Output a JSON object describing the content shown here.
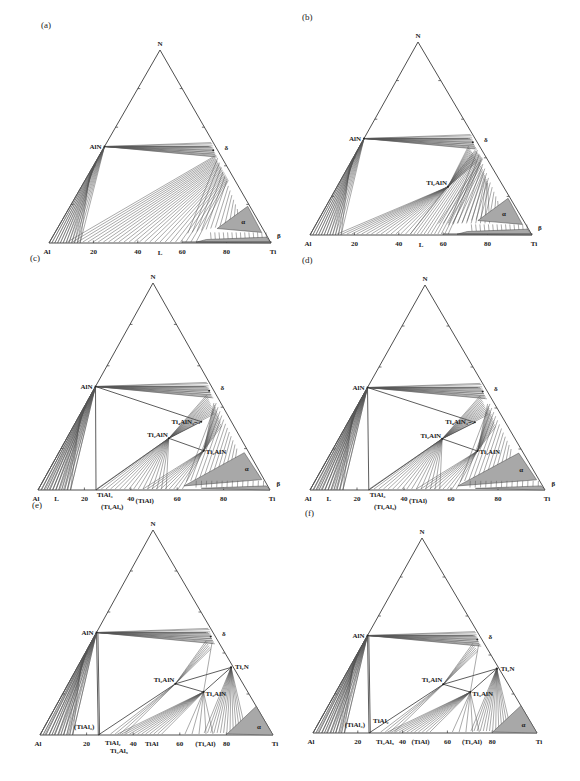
{
  "panels": [
    {
      "id": "a",
      "label": "(a)",
      "geom": {
        "al": [
          49,
          243
        ],
        "ti": [
          271,
          243
        ],
        "n": [
          160,
          50
        ]
      },
      "corners": {
        "al": "Al",
        "ti": "Ti",
        "n": "N"
      },
      "ticks": [
        "20",
        "40",
        "60",
        "80"
      ],
      "phases": [
        {
          "name": "AlN",
          "label": "AlN"
        },
        {
          "name": "delta",
          "label": "δ"
        },
        {
          "name": "alpha",
          "label": "α"
        },
        {
          "name": "beta",
          "label": "β"
        },
        {
          "name": "liquid",
          "label": "L"
        }
      ]
    },
    {
      "id": "b",
      "label": "(b)",
      "geom": {
        "al": [
          310,
          235
        ],
        "ti": [
          532,
          235
        ],
        "n": [
          418,
          42
        ]
      },
      "corners": {
        "al": "Al",
        "ti": "Ti",
        "n": "N"
      },
      "ticks": [
        "20",
        "40",
        "60",
        "80"
      ],
      "phases": [
        {
          "name": "AlN",
          "label": "AlN"
        },
        {
          "name": "delta",
          "label": "δ"
        },
        {
          "name": "Ti2AlN",
          "label": "Ti₂AlN"
        },
        {
          "name": "alpha",
          "label": "α"
        },
        {
          "name": "beta",
          "label": "β"
        },
        {
          "name": "liquid",
          "label": "L"
        }
      ]
    },
    {
      "id": "c",
      "label": "(c)",
      "geom": {
        "al": [
          38,
          490
        ],
        "ti": [
          270,
          490
        ],
        "n": [
          153,
          283
        ]
      },
      "corners": {
        "al": "Al",
        "ti": "Ti",
        "n": "N"
      },
      "ticks": [
        "20",
        "40",
        "60",
        "80"
      ],
      "phases": [
        {
          "name": "AlN",
          "label": "AlN"
        },
        {
          "name": "delta",
          "label": "δ"
        },
        {
          "name": "Ti4AlN3",
          "label": "Ti₄AlN₃₋ₓ"
        },
        {
          "name": "Ti2AlN",
          "label": "Ti₂AlN"
        },
        {
          "name": "Ti3AlN",
          "label": "Ti₃AlN"
        },
        {
          "name": "alpha",
          "label": "α"
        },
        {
          "name": "beta",
          "label": "β"
        },
        {
          "name": "liquid",
          "label": "L"
        },
        {
          "name": "TiAl3",
          "label": "TiAl₃"
        },
        {
          "name": "Ti2Al5",
          "label": "(Ti₂Al₅)"
        },
        {
          "name": "TiAl",
          "label": "(TiAl)"
        }
      ]
    },
    {
      "id": "d",
      "label": "(d)",
      "geom": {
        "al": [
          310,
          490
        ],
        "ti": [
          545,
          490
        ],
        "n": [
          425,
          285
        ]
      },
      "corners": {
        "al": "Al",
        "ti": "Ti",
        "n": "N"
      },
      "ticks": [
        "20",
        "40",
        "60",
        "80"
      ],
      "phases": [
        {
          "name": "AlN",
          "label": "AlN"
        },
        {
          "name": "delta",
          "label": "δ"
        },
        {
          "name": "Ti4AlN3",
          "label": "Ti₄AlN₃₋ₓ"
        },
        {
          "name": "Ti2AlN",
          "label": "Ti₂AlN"
        },
        {
          "name": "Ti3AlN",
          "label": "Ti₃AlN"
        },
        {
          "name": "alpha",
          "label": "α"
        },
        {
          "name": "beta",
          "label": "β"
        },
        {
          "name": "liquid",
          "label": "L"
        },
        {
          "name": "TiAl3",
          "label": "TiAl₃"
        },
        {
          "name": "Ti2Al5",
          "label": "(Ti₂Al₅)"
        },
        {
          "name": "TiAl",
          "label": "(TiAl)"
        }
      ]
    },
    {
      "id": "e",
      "label": "(e)",
      "geom": {
        "al": [
          40,
          735
        ],
        "ti": [
          273,
          735
        ],
        "n": [
          153,
          530
        ]
      },
      "corners": {
        "al": "Al",
        "ti": "Ti",
        "n": "N"
      },
      "ticks": [
        "20",
        "40",
        "60",
        "80"
      ],
      "phases": [
        {
          "name": "AlN",
          "label": "AlN"
        },
        {
          "name": "delta",
          "label": "δ"
        },
        {
          "name": "Ti2N",
          "label": "Ti₂N"
        },
        {
          "name": "Ti2AlN",
          "label": "Ti₂AlN"
        },
        {
          "name": "Ti3AlN",
          "label": "Ti₃AlN"
        },
        {
          "name": "alpha",
          "label": "α"
        },
        {
          "name": "TiAl3",
          "label": "(TiAl₃)"
        },
        {
          "name": "TiAl2",
          "label": "TiAl₂"
        },
        {
          "name": "Ti3Al5",
          "label": "Ti₃Al₅"
        },
        {
          "name": "TiAl",
          "label": "TiAl"
        },
        {
          "name": "Ti3Al",
          "label": "(Ti₃Al)"
        }
      ]
    },
    {
      "id": "f",
      "label": "(f)",
      "geom": {
        "al": [
          313,
          733
        ],
        "ti": [
          537,
          733
        ],
        "n": [
          422,
          538
        ]
      },
      "corners": {
        "al": "Al",
        "ti": "Ti",
        "n": "N"
      },
      "ticks": [
        "20",
        "40",
        "60",
        "80"
      ],
      "phases": [
        {
          "name": "AlN",
          "label": "AlN"
        },
        {
          "name": "delta",
          "label": "δ"
        },
        {
          "name": "Ti2N",
          "label": "Ti₂N"
        },
        {
          "name": "Ti2AlN",
          "label": "Ti₂AlN"
        },
        {
          "name": "Ti3AlN",
          "label": "Ti₃AlN"
        },
        {
          "name": "alpha",
          "label": "α"
        },
        {
          "name": "TiAl3",
          "label": "(TiAl₃)"
        },
        {
          "name": "TiAl2",
          "label": "TiAl₂"
        },
        {
          "name": "Ti3Al5",
          "label": "Ti₃Al₅"
        },
        {
          "name": "TiAl",
          "label": "(TiAl)"
        },
        {
          "name": "Ti3Al",
          "label": "(Ti₃Al)"
        }
      ]
    }
  ]
}
